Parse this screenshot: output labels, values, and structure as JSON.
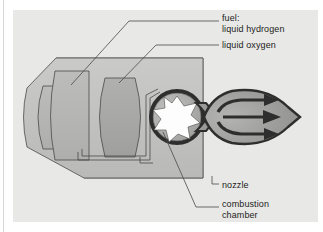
{
  "figure": {
    "background_color": "#ffffff",
    "panel_color": "#e8e8e6",
    "line_color": "#3a3a3a"
  },
  "labels": [
    {
      "id": "fuel",
      "name": "label-fuel",
      "text": "fuel:\nliquid hydrogen"
    },
    {
      "id": "lox",
      "name": "label-liquid-oxygen",
      "text": "liquid oxygen"
    },
    {
      "id": "nozzle",
      "name": "label-nozzle",
      "text": "nozzle"
    },
    {
      "id": "comb",
      "name": "label-combustion-chamber",
      "text": "combustion\nchamber"
    }
  ],
  "parts": {
    "fuel_tank": {
      "label": "fuel: liquid hydrogen",
      "fill": "#b4b4b2"
    },
    "lox_tank": {
      "label": "liquid oxygen",
      "fill": "#a8a8a6"
    },
    "combustion_chamber": {
      "label": "combustion chamber",
      "fill": "#ffffff",
      "ring": "#2e2e2e"
    },
    "nozzle": {
      "label": "nozzle",
      "fill": "#9a9a98"
    },
    "exhaust_plume": {
      "label": "exhaust",
      "fill": "#9e9e9c",
      "arrows": 3
    },
    "body_shell": {
      "fill": "#c2c2c0"
    },
    "inner_block": {
      "fill": "#a9a9a7"
    }
  }
}
